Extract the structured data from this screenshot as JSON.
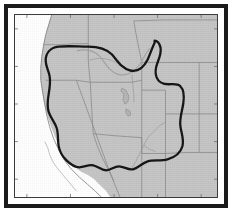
{
  "figure": {
    "kind": "reference-map",
    "frame": {
      "outer_border_color": "#1b1b1b",
      "inner_border_color": "#3a3a3a",
      "matte_color": "#ffffff"
    }
  },
  "legend_colors": {
    "land_fill": "#c5c5c5",
    "ocean_fill": "#ffffff",
    "state_boundary": "#8a8a8a",
    "coastline": "#7d7d7d",
    "hydrography": "#9a9a9a",
    "study_contour": "#141414",
    "secondary_contour": "#a2a2a2",
    "graticule_tick": "#6e6e6e"
  },
  "layers": [
    {
      "name": "land-polygon",
      "label": "Land",
      "fill": "#c5c5c5"
    },
    {
      "name": "ocean-polygon",
      "label": "Pacific Ocean",
      "fill": "#ffffff"
    },
    {
      "name": "state-boundaries",
      "label": "State boundaries",
      "stroke": "#8a8a8a"
    },
    {
      "name": "hydrography",
      "label": "Rivers and lakes",
      "stroke": "#9a9a9a"
    },
    {
      "name": "study-contour",
      "label": "Study region boundary",
      "stroke": "#141414"
    },
    {
      "name": "secondary-contour",
      "label": "Secondary contour",
      "stroke": "#a2a2a2"
    }
  ],
  "hydrography_features": [
    {
      "name": "snake-river",
      "label": "Snake River"
    },
    {
      "name": "colorado-river",
      "label": "Colorado River"
    },
    {
      "name": "great-salt-lake",
      "label": "Great Salt Lake"
    },
    {
      "name": "utah-lake",
      "label": "Utah Lake"
    }
  ],
  "graticule": {
    "tick_marks_visible": true,
    "tick_label_legible": false,
    "top_tick_count": 5,
    "bottom_tick_count": 5,
    "left_tick_count": 5,
    "right_tick_count": 5,
    "tick_label_text": ""
  }
}
